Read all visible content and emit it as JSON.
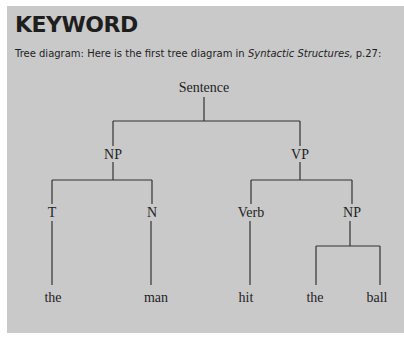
{
  "keyword": {
    "title": "KEYWORD",
    "caption_prefix": "Tree diagram: Here is the first tree diagram in ",
    "caption_italic": "Syntactic Structures",
    "caption_suffix": ", p.27:"
  },
  "tree": {
    "root": "Sentence",
    "level1": [
      "NP",
      "VP"
    ],
    "level2": [
      "T",
      "N",
      "Verb",
      "NP"
    ],
    "leaves": [
      "the",
      "man",
      "hit",
      "the",
      "ball"
    ]
  },
  "colors": {
    "panel": "#c9c9c9",
    "text": "#1e1e1e"
  }
}
